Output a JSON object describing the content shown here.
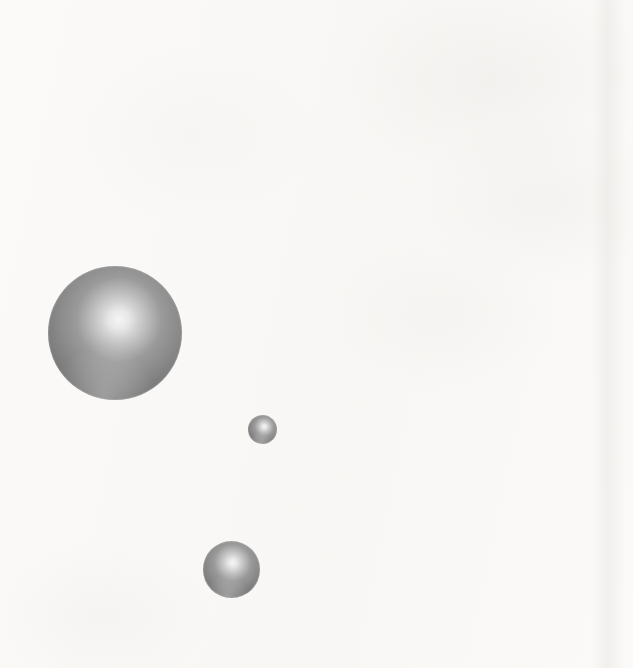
{
  "figure": {
    "canvas": {
      "width": 633,
      "height": 668
    },
    "background_color": "#fbfaf8",
    "shading": {
      "highlight_color": "#f5f5f5",
      "midtone_color": "#9a9a9a",
      "edge_color": "#6a6a6a",
      "terminator_color": "#636363",
      "light_direction": "upper-right"
    },
    "spheres": [
      {
        "id": "large-sphere",
        "label": "Large sphere",
        "center_x": 115,
        "center_y": 333,
        "diameter": 134,
        "highlight_x_pct": 53,
        "highlight_y_pct": 40
      },
      {
        "id": "small-sphere",
        "label": "Small sphere",
        "center_x": 262,
        "center_y": 429,
        "diameter": 29,
        "highlight_x_pct": 56,
        "highlight_y_pct": 40
      },
      {
        "id": "medium-sphere",
        "label": "Medium sphere",
        "center_x": 231,
        "center_y": 569,
        "diameter": 57,
        "highlight_x_pct": 52,
        "highlight_y_pct": 38
      }
    ],
    "scan_bands": [
      {
        "id": "right-scan-band",
        "left": 592
      }
    ]
  }
}
